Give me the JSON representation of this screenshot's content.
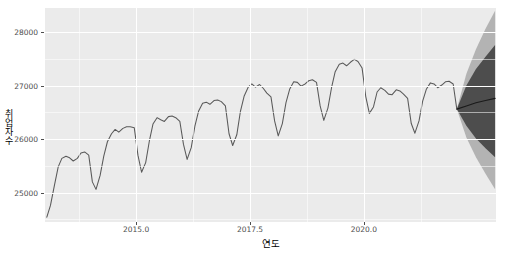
{
  "chart_data": {
    "type": "line",
    "title": "",
    "xlabel": "연도",
    "ylabel": "취업자수",
    "xlim": [
      2013.0,
      2022.9
    ],
    "ylim": [
      24450,
      28450
    ],
    "xticks": [
      2015.0,
      2017.5,
      2020.0
    ],
    "xticklabels": [
      "2015.0",
      "2017.5",
      "2020.0"
    ],
    "yticks": [
      25000,
      26000,
      27000,
      28000
    ],
    "yticklabels": [
      "25000",
      "26000",
      "27000",
      "28000"
    ],
    "grid": true,
    "legend": "none",
    "series": [
      {
        "name": "취업자수 (관측값)",
        "type": "line",
        "color": "#595959",
        "x": [
          2013.04,
          2013.12,
          2013.21,
          2013.29,
          2013.37,
          2013.46,
          2013.54,
          2013.62,
          2013.71,
          2013.79,
          2013.87,
          2013.96,
          2014.04,
          2014.12,
          2014.21,
          2014.29,
          2014.37,
          2014.46,
          2014.54,
          2014.62,
          2014.71,
          2014.79,
          2014.87,
          2014.96,
          2015.04,
          2015.12,
          2015.21,
          2015.29,
          2015.37,
          2015.46,
          2015.54,
          2015.62,
          2015.71,
          2015.79,
          2015.87,
          2015.96,
          2016.04,
          2016.12,
          2016.21,
          2016.29,
          2016.37,
          2016.46,
          2016.54,
          2016.62,
          2016.71,
          2016.79,
          2016.87,
          2016.96,
          2017.04,
          2017.12,
          2017.21,
          2017.29,
          2017.37,
          2017.46,
          2017.54,
          2017.62,
          2017.71,
          2017.79,
          2017.87,
          2017.96,
          2018.04,
          2018.12,
          2018.21,
          2018.29,
          2018.37,
          2018.46,
          2018.54,
          2018.62,
          2018.71,
          2018.79,
          2018.87,
          2018.96,
          2019.04,
          2019.12,
          2019.21,
          2019.29,
          2019.37,
          2019.46,
          2019.54,
          2019.62,
          2019.71,
          2019.79,
          2019.87,
          2019.96,
          2020.04,
          2020.12,
          2020.21,
          2020.29,
          2020.37,
          2020.46,
          2020.54,
          2020.62,
          2020.71,
          2020.79,
          2020.87,
          2020.96,
          2021.04,
          2021.12,
          2021.21,
          2021.29,
          2021.37,
          2021.46,
          2021.54,
          2021.62,
          2021.71,
          2021.79,
          2021.87,
          2021.96,
          2022.04
        ],
        "y": [
          24540,
          24760,
          25150,
          25480,
          25640,
          25680,
          25650,
          25590,
          25640,
          25740,
          25760,
          25700,
          25200,
          25060,
          25320,
          25680,
          25950,
          26100,
          26180,
          26130,
          26200,
          26230,
          26230,
          26210,
          25700,
          25380,
          25560,
          25960,
          26280,
          26400,
          26360,
          26330,
          26420,
          26430,
          26400,
          26330,
          25900,
          25620,
          25840,
          26240,
          26520,
          26670,
          26690,
          26650,
          26720,
          26730,
          26700,
          26620,
          26100,
          25880,
          26080,
          26520,
          26800,
          26970,
          27030,
          26970,
          27020,
          26950,
          26860,
          26790,
          26340,
          26060,
          26290,
          26680,
          26930,
          27070,
          27060,
          26990,
          27030,
          27090,
          27110,
          27060,
          26620,
          26350,
          26580,
          26960,
          27260,
          27400,
          27420,
          27370,
          27440,
          27490,
          27450,
          27330,
          26800,
          26480,
          26600,
          26880,
          26960,
          26910,
          26840,
          26830,
          26920,
          26900,
          26840,
          26760,
          26290,
          26110,
          26340,
          26710,
          26930,
          27050,
          27030,
          26960,
          27010,
          27070,
          27080,
          27030,
          26560
        ]
      },
      {
        "name": "예측값",
        "type": "line",
        "color": "#1a1a1a",
        "x": [
          2022.04,
          2022.25,
          2022.46,
          2022.67,
          2022.88
        ],
        "y": [
          26560,
          26620,
          26680,
          26720,
          26760
        ]
      }
    ],
    "intervals": [
      {
        "name": "95% 예측구간",
        "color": "#b3b3b3",
        "x": [
          2022.04,
          2022.25,
          2022.46,
          2022.67,
          2022.88
        ],
        "lower": [
          26560,
          26030,
          25660,
          25350,
          25060
        ],
        "upper": [
          26560,
          27220,
          27680,
          28060,
          28400
        ]
      },
      {
        "name": "80% 예측구간",
        "color": "#4d4d4d",
        "x": [
          2022.04,
          2022.25,
          2022.46,
          2022.67,
          2022.88
        ],
        "lower": [
          26560,
          26250,
          26010,
          25830,
          25660
        ],
        "upper": [
          26560,
          27000,
          27310,
          27540,
          27760
        ]
      }
    ],
    "colors": {
      "panel_background": "#ebebeb",
      "grid": "#ffffff",
      "line": "#595959",
      "forecast_line": "#1a1a1a",
      "band_95": "#b3b3b3",
      "band_80": "#4d4d4d",
      "axis_text": "#4d4d4d",
      "axis_title": "#000000"
    }
  },
  "axis": {
    "ylabel_chars": [
      "취",
      "업",
      "자",
      "수"
    ]
  }
}
